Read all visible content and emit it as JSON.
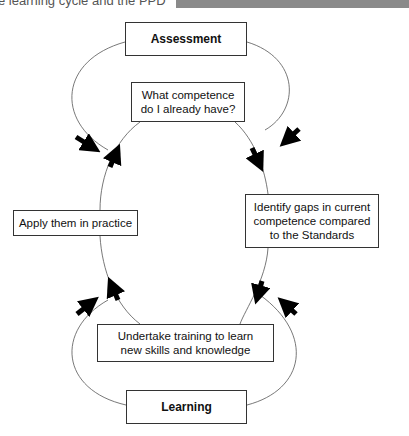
{
  "header": {
    "caption_fragment": "e learning cycle and the PPD"
  },
  "diagram": {
    "nodes": {
      "assessment": "Assessment",
      "what_competence": "What competence do I already have?",
      "identify_gaps": "Identify gaps in current competence compared to the Standards",
      "apply": "Apply them in practice",
      "training": "Undertake training to learn new skills and knowledge",
      "learning": "Learning"
    },
    "edges": [
      {
        "from": "assessment",
        "to": "apply",
        "direction": "arrow-in"
      },
      {
        "from": "assessment",
        "to": "identify_gaps",
        "direction": "arrow-in"
      },
      {
        "from": "what_competence",
        "to": "identify_gaps"
      },
      {
        "from": "identify_gaps",
        "to": "training"
      },
      {
        "from": "training",
        "to": "apply"
      },
      {
        "from": "apply",
        "to": "what_competence"
      },
      {
        "from": "learning",
        "to": "apply",
        "direction": "arrow-in"
      },
      {
        "from": "learning",
        "to": "training",
        "direction": "arrow-in"
      }
    ]
  }
}
